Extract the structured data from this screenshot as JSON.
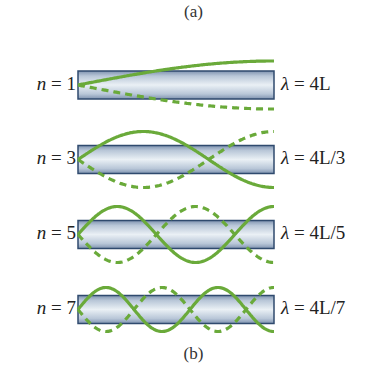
{
  "figure": {
    "caption_top": "(a)",
    "caption_bottom": "(b)"
  },
  "colors": {
    "wave": "#6aaa3a",
    "tube_border": "#2f4a6e",
    "tube_center": "#e8eef4",
    "tube_edge": "#8fa3bf"
  },
  "modes": [
    {
      "n_label": "n = 1",
      "n_var": "n",
      "n_eq": " = 1",
      "lambda_var": "λ",
      "lambda_eq": " = 4L",
      "n": 1,
      "wavelength": "4L"
    },
    {
      "n_label": "n = 3",
      "n_var": "n",
      "n_eq": " = 3",
      "lambda_var": "λ",
      "lambda_eq": " = 4L/3",
      "n": 3,
      "wavelength": "4L/3"
    },
    {
      "n_label": "n = 5",
      "n_var": "n",
      "n_eq": " = 5",
      "lambda_var": "λ",
      "lambda_eq": " = 4L/5",
      "n": 5,
      "wavelength": "4L/5"
    },
    {
      "n_label": "n = 7",
      "n_var": "n",
      "n_eq": " = 7",
      "lambda_var": "λ",
      "lambda_eq": " = 4L/7",
      "n": 7,
      "wavelength": "4L/7"
    }
  ]
}
